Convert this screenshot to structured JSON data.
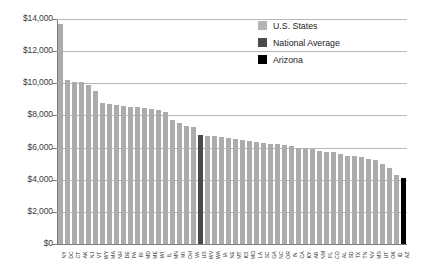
{
  "chart_data": {
    "type": "bar",
    "title": "",
    "xlabel": "",
    "ylabel": "",
    "ylim": [
      0,
      14000
    ],
    "ytick_labels": [
      "$14,000",
      "$12,000",
      "$10,000",
      "$8,000",
      "$6,000",
      "$4,000",
      "$2,000",
      "$0"
    ],
    "ytick_values": [
      14000,
      12000,
      10000,
      8000,
      6000,
      4000,
      2000,
      0
    ],
    "grid": true,
    "legend_position": "top-right",
    "legend": [
      {
        "label": "U.S. States",
        "color": "#b4b4b4",
        "key": "state"
      },
      {
        "label": "National Average",
        "color": "#4a4a4a",
        "key": "natavg"
      },
      {
        "label": "Arizona",
        "color": "#000000",
        "key": "arizona"
      }
    ],
    "categories": [
      "NY",
      "DC",
      "CT",
      "AK",
      "NJ",
      "VT",
      "WY",
      "MA",
      "NH",
      "DE",
      "PA",
      "RI",
      "MD",
      "ME",
      "WI",
      "IL",
      "MN",
      "MI",
      "OH",
      "VA",
      "US",
      "WV",
      "WA",
      "IA",
      "NE",
      "MT",
      "KS",
      "MO",
      "LA",
      "SC",
      "GA",
      "NC",
      "OR",
      "IN",
      "CA",
      "KY",
      "AR",
      "NM",
      "FL",
      "CO",
      "AL",
      "SD",
      "TX",
      "TN",
      "NV",
      "MS",
      "UT",
      "OK",
      "ID",
      "AZ"
    ],
    "values": [
      13700,
      10200,
      10100,
      10050,
      9900,
      9500,
      8800,
      8700,
      8650,
      8600,
      8550,
      8500,
      8450,
      8400,
      8350,
      8200,
      7700,
      7500,
      7350,
      7250,
      6800,
      6750,
      6700,
      6650,
      6600,
      6550,
      6500,
      6400,
      6350,
      6300,
      6250,
      6200,
      6150,
      6100,
      6000,
      5950,
      5900,
      5800,
      5750,
      5700,
      5600,
      5500,
      5450,
      5400,
      5300,
      5200,
      5000,
      4700,
      4300,
      4100
    ],
    "series_keys": [
      "state",
      "state",
      "state",
      "state",
      "state",
      "state",
      "state",
      "state",
      "state",
      "state",
      "state",
      "state",
      "state",
      "state",
      "state",
      "state",
      "state",
      "state",
      "state",
      "state",
      "natavg",
      "state",
      "state",
      "state",
      "state",
      "state",
      "state",
      "state",
      "state",
      "state",
      "state",
      "state",
      "state",
      "state",
      "state",
      "state",
      "state",
      "state",
      "state",
      "state",
      "state",
      "state",
      "state",
      "state",
      "state",
      "state",
      "state",
      "state",
      "state",
      "arizona"
    ]
  }
}
